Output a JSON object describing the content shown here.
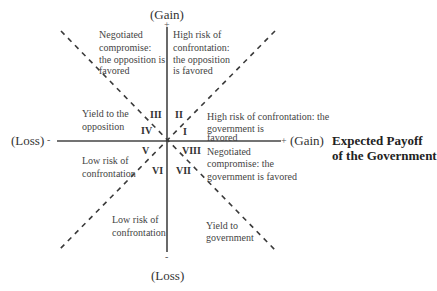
{
  "axes": {
    "top_label": "(Gain)",
    "bottom_label": "(Loss)",
    "left_label": "(Loss)",
    "right_label": "(Gain)",
    "top_sign": "+",
    "bottom_sign": "-",
    "left_sign": "-",
    "right_sign": "+"
  },
  "title": {
    "line1": "Expected Payoff",
    "line2": "of the Government"
  },
  "octants": [
    {
      "numeral": "I"
    },
    {
      "numeral": "II"
    },
    {
      "numeral": "III"
    },
    {
      "numeral": "IV"
    },
    {
      "numeral": "V"
    },
    {
      "numeral": "VI"
    },
    {
      "numeral": "VII"
    },
    {
      "numeral": "VIII"
    }
  ],
  "regions": {
    "top_left": [
      "Negotiated",
      "compromise:",
      "the opposition is",
      "favored"
    ],
    "top_right": [
      "High risk of",
      "confrontation:",
      "the opposition",
      "is favored"
    ],
    "right_upper": [
      "High risk of confrontation: the",
      "government is",
      "favored"
    ],
    "left_upper": [
      "Yield to the",
      "opposition"
    ],
    "left_lower": [
      "Low risk of",
      "confrontation"
    ],
    "right_lower": [
      "Negotiated",
      "compromise: the",
      "government is favored"
    ],
    "bottom_left": [
      "Low risk of",
      "confrontation"
    ],
    "bottom_right": [
      "Yield to",
      "government"
    ]
  }
}
